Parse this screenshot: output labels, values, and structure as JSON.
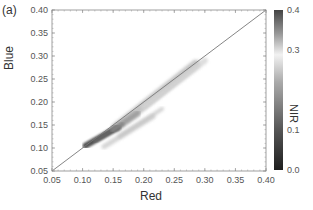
{
  "figure": {
    "panel_label": "(a)",
    "xlabel": "Red",
    "ylabel": "Blue",
    "colorbar_label": "NIR"
  },
  "chart_data": {
    "type": "scatter",
    "title": "",
    "panel_label": "(a)",
    "xlabel": "Red",
    "ylabel": "Blue",
    "xlim": [
      0.05,
      0.4
    ],
    "ylim": [
      0.05,
      0.4
    ],
    "xticks": [
      "0.05",
      "0.10",
      "0.15",
      "0.20",
      "0.25",
      "0.30",
      "0.35",
      "0.40"
    ],
    "yticks": [
      "0.05",
      "0.10",
      "0.15",
      "0.20",
      "0.25",
      "0.30",
      "0.35",
      "0.40"
    ],
    "grid": false,
    "reference_line": {
      "type": "1:1",
      "from": [
        0.05,
        0.05
      ],
      "to": [
        0.4,
        0.4
      ],
      "color": "#777777"
    },
    "colorbar": {
      "label": "NIR",
      "range": [
        0.0,
        0.4
      ],
      "ticks": [
        "0.0",
        "0.1",
        "0.3",
        "0.4"
      ],
      "colormap": "grayscale: dark (0.0) -> light (~0.3) -> dark (0.4)"
    },
    "point_clusters": [
      {
        "name": "low-red dense cluster",
        "x_range": [
          0.1,
          0.16
        ],
        "y_range": [
          0.1,
          0.15
        ],
        "nir_approx": 0.08,
        "shade": "#555555"
      },
      {
        "name": "main band",
        "x_range": [
          0.15,
          0.29
        ],
        "y_range": [
          0.14,
          0.28
        ],
        "nir_approx": 0.25,
        "shade": "#b5b5b5"
      },
      {
        "name": "lower offset band",
        "x_range": [
          0.13,
          0.22
        ],
        "y_range": [
          0.1,
          0.17
        ],
        "nir_approx": 0.22,
        "shade": "#c8c8c8"
      },
      {
        "name": "upper sparse tail",
        "x_range": [
          0.22,
          0.3
        ],
        "y_range": [
          0.22,
          0.29
        ],
        "nir_approx": 0.3,
        "shade": "#dddddd"
      }
    ]
  }
}
